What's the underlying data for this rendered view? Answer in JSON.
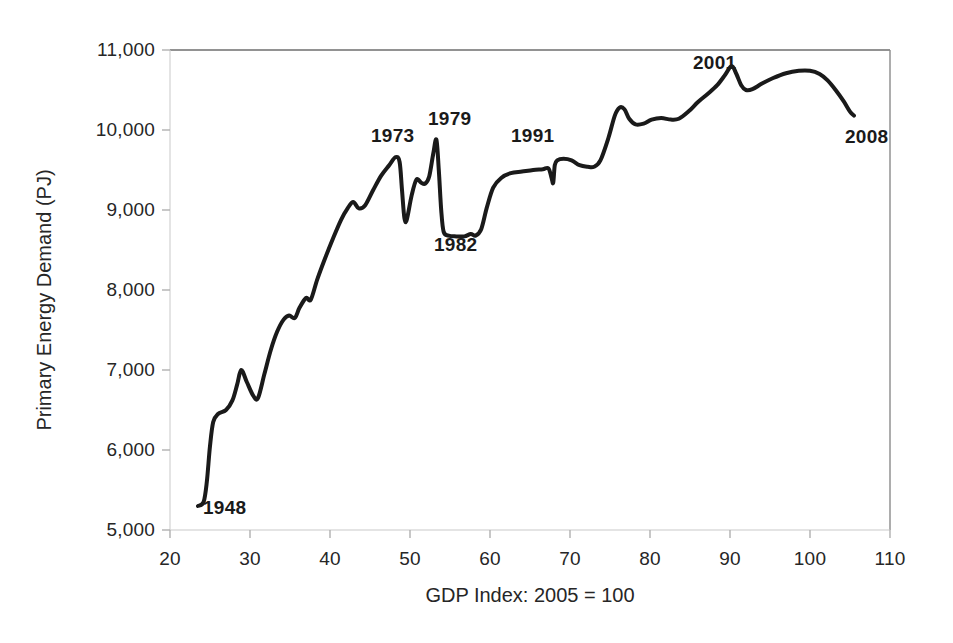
{
  "chart_data": {
    "type": "line",
    "title": "",
    "subtitle": "",
    "xlabel": "GDP Index: 2005 = 100",
    "ylabel": "Primary Energy Demand (PJ)",
    "xlim": [
      20,
      110
    ],
    "ylim": [
      5000,
      11000
    ],
    "xticks": [
      20,
      30,
      40,
      50,
      60,
      70,
      80,
      90,
      100,
      110
    ],
    "xtick_labels": [
      "20",
      "30",
      "40",
      "50",
      "60",
      "70",
      "80",
      "90",
      "100",
      "110"
    ],
    "yticks": [
      5000,
      6000,
      7000,
      8000,
      9000,
      10000,
      11000
    ],
    "ytick_labels": [
      "5,000",
      "6,000",
      "7,000",
      "8,000",
      "9,000",
      "10,000",
      "11,000"
    ],
    "grid": false,
    "legend": "none",
    "line_color": "#1a1a1a",
    "line_width": 4,
    "series": [
      {
        "name": "Primary Energy Demand",
        "x_name": "GDP Index (2005 = 100)",
        "y_name": "Primary Energy Demand (PJ)",
        "points": [
          [
            23.5,
            5300
          ],
          [
            24.2,
            5350
          ],
          [
            24.6,
            5600
          ],
          [
            25.0,
            6050
          ],
          [
            25.4,
            6350
          ],
          [
            26.0,
            6450
          ],
          [
            27.0,
            6500
          ],
          [
            27.8,
            6620
          ],
          [
            28.4,
            6820
          ],
          [
            28.9,
            7000
          ],
          [
            29.6,
            6850
          ],
          [
            30.4,
            6680
          ],
          [
            31.0,
            6650
          ],
          [
            31.8,
            6950
          ],
          [
            32.6,
            7250
          ],
          [
            33.4,
            7480
          ],
          [
            34.2,
            7630
          ],
          [
            34.9,
            7680
          ],
          [
            35.6,
            7650
          ],
          [
            36.2,
            7780
          ],
          [
            37.0,
            7900
          ],
          [
            37.6,
            7880
          ],
          [
            38.4,
            8130
          ],
          [
            39.4,
            8400
          ],
          [
            40.4,
            8650
          ],
          [
            41.4,
            8880
          ],
          [
            42.2,
            9020
          ],
          [
            42.9,
            9100
          ],
          [
            43.6,
            9020
          ],
          [
            44.4,
            9060
          ],
          [
            45.4,
            9250
          ],
          [
            46.4,
            9430
          ],
          [
            47.4,
            9560
          ],
          [
            48.2,
            9660
          ],
          [
            48.7,
            9600
          ],
          [
            49.0,
            9250
          ],
          [
            49.3,
            8900
          ],
          [
            49.6,
            8880
          ],
          [
            50.2,
            9180
          ],
          [
            50.8,
            9380
          ],
          [
            51.4,
            9340
          ],
          [
            51.9,
            9330
          ],
          [
            52.4,
            9420
          ],
          [
            52.9,
            9700
          ],
          [
            53.3,
            9880
          ],
          [
            53.6,
            9500
          ],
          [
            53.9,
            9000
          ],
          [
            54.2,
            8730
          ],
          [
            54.8,
            8680
          ],
          [
            55.8,
            8670
          ],
          [
            56.8,
            8670
          ],
          [
            57.6,
            8700
          ],
          [
            58.2,
            8680
          ],
          [
            58.9,
            8760
          ],
          [
            59.6,
            9030
          ],
          [
            60.4,
            9280
          ],
          [
            61.4,
            9400
          ],
          [
            62.6,
            9460
          ],
          [
            64.0,
            9480
          ],
          [
            65.4,
            9500
          ],
          [
            66.6,
            9510
          ],
          [
            67.3,
            9520
          ],
          [
            67.7,
            9400
          ],
          [
            67.9,
            9340
          ],
          [
            68.1,
            9560
          ],
          [
            68.4,
            9620
          ],
          [
            69.2,
            9640
          ],
          [
            70.2,
            9620
          ],
          [
            71.2,
            9560
          ],
          [
            72.2,
            9540
          ],
          [
            73.0,
            9540
          ],
          [
            73.8,
            9620
          ],
          [
            74.8,
            9900
          ],
          [
            75.6,
            10180
          ],
          [
            76.2,
            10280
          ],
          [
            76.8,
            10260
          ],
          [
            77.4,
            10140
          ],
          [
            78.2,
            10070
          ],
          [
            79.2,
            10080
          ],
          [
            80.2,
            10130
          ],
          [
            81.4,
            10150
          ],
          [
            82.6,
            10130
          ],
          [
            83.6,
            10140
          ],
          [
            84.8,
            10230
          ],
          [
            86.0,
            10350
          ],
          [
            87.2,
            10450
          ],
          [
            88.4,
            10560
          ],
          [
            89.4,
            10690
          ],
          [
            90.2,
            10800
          ],
          [
            90.8,
            10700
          ],
          [
            91.4,
            10560
          ],
          [
            92.0,
            10500
          ],
          [
            92.8,
            10510
          ],
          [
            94.0,
            10580
          ],
          [
            95.4,
            10650
          ],
          [
            97.0,
            10710
          ],
          [
            98.6,
            10740
          ],
          [
            100.0,
            10740
          ],
          [
            101.2,
            10700
          ],
          [
            102.2,
            10620
          ],
          [
            103.2,
            10500
          ],
          [
            104.2,
            10360
          ],
          [
            105.0,
            10230
          ],
          [
            105.5,
            10180
          ]
        ]
      }
    ],
    "annotations": [
      {
        "label": "1948",
        "x": 25.5,
        "y": 5130,
        "anchor": "left-below"
      },
      {
        "label": "1973",
        "x": 47.0,
        "y": 9960,
        "anchor": "above"
      },
      {
        "label": "1979",
        "x": 54.2,
        "y": 10180,
        "anchor": "above"
      },
      {
        "label": "1982",
        "x": 57.5,
        "y": 8470,
        "anchor": "below"
      },
      {
        "label": "1991",
        "x": 65.0,
        "y": 9830,
        "anchor": "above-left"
      },
      {
        "label": "2001",
        "x": 88.0,
        "y": 11010,
        "anchor": "above-left"
      },
      {
        "label": "2008",
        "x": 107.6,
        "y": 9990,
        "anchor": "right"
      }
    ],
    "axis": {
      "frame_color": "#808080",
      "tick_color": "#a6a6a6",
      "show_top_border": true,
      "show_right_border": true
    }
  }
}
